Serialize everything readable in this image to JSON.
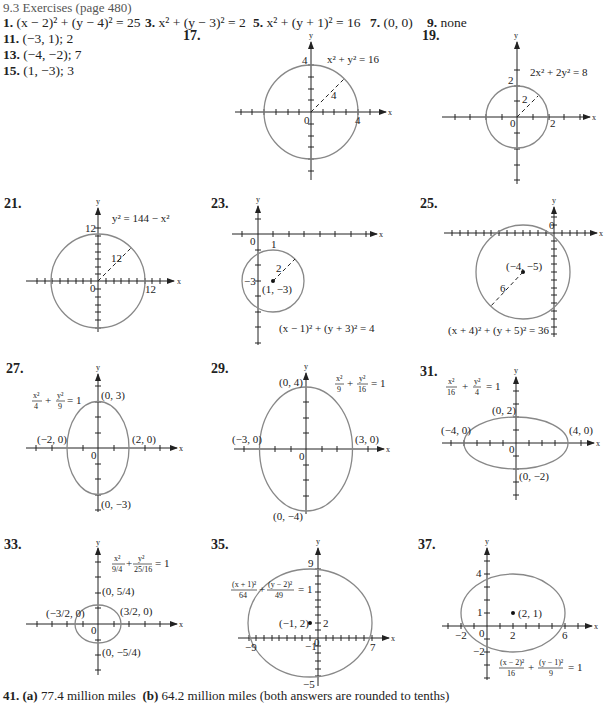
{
  "header": {
    "title": "9.3 Exercises (page 480)"
  },
  "answers": [
    {
      "num": "1.",
      "text": "(x − 2)² + (y − 4)² = 25"
    },
    {
      "num": "3.",
      "text": "x² + (y − 3)² = 2"
    },
    {
      "num": "5.",
      "text": "x² + (y + 1)² = 16"
    },
    {
      "num": "7.",
      "text": "(0, 0)"
    },
    {
      "num": "9.",
      "text": "none"
    },
    {
      "num": "11.",
      "text": "(−3, 1);   2"
    },
    {
      "num": "13.",
      "text": "(−4, −2);   7"
    },
    {
      "num": "15.",
      "text": "(1, −3);   3"
    }
  ],
  "graphs": {
    "g17": {
      "num": "17.",
      "eq": "x² + y² = 16",
      "radius_label": "4",
      "x_tick": "4",
      "y_tick": "4",
      "origin": "0",
      "x_axis": "x",
      "y_axis": "y"
    },
    "g19": {
      "num": "19.",
      "eq": "2x² + 2y² = 8",
      "radius_label": "2",
      "x_tick": "2",
      "y_tick": "2",
      "origin": "0",
      "x_axis": "x",
      "y_axis": "y"
    },
    "g21": {
      "num": "21.",
      "eq": "y² = 144 − x²",
      "radius_label": "12",
      "x_tick": "12",
      "y_tick": "12",
      "origin": "0",
      "x_axis": "x",
      "y_axis": "y"
    },
    "g23": {
      "num": "23.",
      "eq": "(x − 1)² + (y + 3)² = 4",
      "radius_label": "2",
      "center": "(1, −3)",
      "x_tick": "1",
      "y_tick": "−3",
      "origin": "0",
      "x_axis": "x",
      "y_axis": "y"
    },
    "g25": {
      "num": "25.",
      "eq": "(x + 4)² + (y + 5)² = 36",
      "radius_label": "6",
      "center": "(−4, −5)",
      "origin": "0",
      "x_axis": "x",
      "y_axis": "y"
    },
    "g27": {
      "num": "27.",
      "eq_a": "x²",
      "eq_b": "4",
      "eq_c": "y²",
      "eq_d": "9",
      "eq_rhs": "= 1",
      "top": "(0, 3)",
      "bottom": "(0, −3)",
      "left": "(−2, 0)",
      "right": "(2, 0)",
      "origin": "0",
      "x_axis": "x",
      "y_axis": "y"
    },
    "g29": {
      "num": "29.",
      "eq_a": "x²",
      "eq_b": "9",
      "eq_c": "y²",
      "eq_d": "16",
      "eq_rhs": "= 1",
      "top": "(0, 4)",
      "bottom": "(0, −4)",
      "left": "(−3, 0)",
      "right": "(3, 0)",
      "origin": "0",
      "x_axis": "x",
      "y_axis": "y"
    },
    "g31": {
      "num": "31.",
      "eq_a": "x²",
      "eq_b": "16",
      "eq_c": "y²",
      "eq_d": "4",
      "eq_rhs": "= 1",
      "top": "(0, 2)",
      "bottom": "(0, −2)",
      "left": "(−4, 0)",
      "right": "(4, 0)",
      "origin": "0",
      "x_axis": "x",
      "y_axis": "y"
    },
    "g33": {
      "num": "33.",
      "eq_a": "x²",
      "eq_b": "9/4",
      "eq_c": "y²",
      "eq_d": "25/16",
      "eq_rhs": "= 1",
      "top": "(0, 5/4)",
      "bottom": "(0, −5/4)",
      "left": "(−3/2, 0)",
      "right": "(3/2, 0)",
      "origin": "0",
      "x_axis": "x",
      "y_axis": "y"
    },
    "g35": {
      "num": "35.",
      "eq_a": "(x + 1)²",
      "eq_b": "64",
      "eq_c": "(y − 2)²",
      "eq_d": "49",
      "eq_rhs": "= 1",
      "center": "(−1, 2)",
      "y_top": "9",
      "y_bottom": "−5",
      "y_center": "2",
      "x_left": "−9",
      "x_right": "7",
      "x_center": "−1",
      "origin": "0",
      "x_axis": "x",
      "y_axis": "y"
    },
    "g37": {
      "num": "37.",
      "eq_a": "(x − 2)²",
      "eq_b": "16",
      "eq_c": "(y − 1)²",
      "eq_d": "9",
      "eq_rhs": "= 1",
      "center": "(2, 1)",
      "y_top": "4",
      "y_center": "1",
      "y_bottom": "−2",
      "x_left": "−2",
      "x_center": "2",
      "x_right": "6",
      "origin": "0",
      "x_axis": "x",
      "y_axis": "y"
    }
  },
  "footer": {
    "num": "41.",
    "a_label": "(a)",
    "a_text": "77.4 million miles",
    "b_label": "(b)",
    "b_text": "64.2 million miles (both answers are rounded to tenths)"
  }
}
